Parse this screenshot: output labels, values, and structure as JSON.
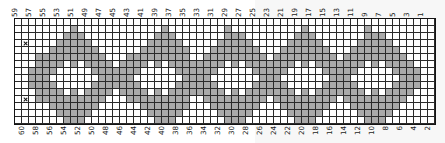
{
  "chart_data": {
    "type": "heatmap",
    "title": "",
    "xlabel": "",
    "ylabel": "",
    "columns": 60,
    "rows": 15,
    "grid_on": true,
    "legend": [],
    "colors": {
      "filled": "#a9a9a9",
      "empty": "#ffffff",
      "gridline": "#2a2a2a",
      "border": "#141414",
      "mark": "#141414"
    },
    "top_axis_labels": [
      "59",
      "",
      "57",
      "",
      "55",
      "",
      "53",
      "",
      "51",
      "",
      "49",
      "",
      "47",
      "",
      "45",
      "",
      "43",
      "",
      "41",
      "",
      "39",
      "",
      "37",
      "",
      "35",
      "",
      "33",
      "",
      "31",
      "",
      "29",
      "",
      "27",
      "",
      "25",
      "",
      "23",
      "",
      "21",
      "",
      "19",
      "",
      "17",
      "",
      "15",
      "",
      "13",
      "",
      "11",
      "",
      "9",
      "",
      "7",
      "",
      "5",
      "",
      "3",
      "",
      "1",
      ""
    ],
    "bottom_axis_labels": [
      "60",
      "",
      "58",
      "",
      "56",
      "",
      "54",
      "",
      "52",
      "",
      "50",
      "",
      "48",
      "",
      "46",
      "",
      "44",
      "",
      "42",
      "",
      "40",
      "",
      "38",
      "",
      "36",
      "",
      "34",
      "",
      "32",
      "",
      "30",
      "",
      "28",
      "",
      "26",
      "",
      "24",
      "",
      "22",
      "",
      "20",
      "",
      "18",
      "",
      "16",
      "",
      "14",
      "",
      "12",
      "",
      "10",
      "",
      "8",
      "",
      "6",
      "",
      "4",
      "",
      "2",
      ""
    ],
    "marks": [
      {
        "row": 3,
        "col": 1,
        "symbol": "x"
      },
      {
        "row": 11,
        "col": 1,
        "symbol": "x"
      }
    ],
    "matrix": [
      [
        0,
        0,
        0,
        0,
        0,
        0,
        0,
        0,
        0,
        0,
        0,
        0,
        0,
        0,
        0,
        0,
        0,
        0,
        0,
        0,
        0,
        0,
        0,
        0,
        0,
        0,
        0,
        0,
        0,
        0,
        0,
        0,
        0,
        0,
        0,
        0,
        0,
        0,
        0,
        0,
        0,
        0,
        0,
        0,
        0,
        0,
        0,
        0,
        0,
        0,
        0,
        0,
        0,
        0,
        0,
        0,
        0,
        0,
        0,
        0
      ],
      [
        0,
        0,
        0,
        0,
        0,
        0,
        0,
        0,
        1,
        0,
        0,
        0,
        0,
        0,
        0,
        0,
        0,
        0,
        0,
        0,
        0,
        1,
        0,
        0,
        0,
        0,
        0,
        0,
        0,
        0,
        1,
        0,
        0,
        0,
        0,
        0,
        0,
        0,
        0,
        0,
        0,
        1,
        0,
        0,
        0,
        0,
        0,
        0,
        0,
        0,
        1,
        0,
        0,
        0,
        0,
        0,
        0,
        0,
        0,
        0
      ],
      [
        0,
        0,
        0,
        0,
        0,
        0,
        0,
        1,
        1,
        1,
        0,
        0,
        0,
        0,
        0,
        0,
        0,
        0,
        0,
        0,
        1,
        1,
        1,
        0,
        0,
        0,
        0,
        0,
        0,
        0,
        1,
        1,
        1,
        0,
        0,
        0,
        0,
        0,
        0,
        0,
        1,
        1,
        1,
        0,
        0,
        0,
        0,
        0,
        0,
        0,
        1,
        1,
        1,
        0,
        0,
        0,
        0,
        0,
        0,
        0
      ],
      [
        0,
        0,
        0,
        0,
        0,
        0,
        1,
        1,
        1,
        1,
        1,
        0,
        0,
        0,
        0,
        0,
        0,
        0,
        0,
        1,
        1,
        1,
        1,
        1,
        0,
        0,
        0,
        0,
        0,
        1,
        1,
        1,
        1,
        1,
        0,
        0,
        0,
        0,
        0,
        1,
        1,
        1,
        1,
        1,
        0,
        0,
        0,
        0,
        0,
        1,
        1,
        1,
        1,
        1,
        0,
        0,
        0,
        0,
        0,
        0
      ],
      [
        0,
        0,
        0,
        0,
        0,
        1,
        1,
        1,
        1,
        1,
        1,
        1,
        0,
        0,
        0,
        0,
        0,
        0,
        1,
        1,
        1,
        1,
        1,
        1,
        1,
        0,
        0,
        0,
        1,
        1,
        1,
        1,
        1,
        1,
        1,
        0,
        0,
        0,
        1,
        1,
        1,
        1,
        1,
        1,
        1,
        0,
        0,
        0,
        1,
        1,
        1,
        1,
        1,
        1,
        1,
        0,
        0,
        0,
        0,
        0
      ],
      [
        0,
        0,
        0,
        1,
        1,
        1,
        1,
        1,
        1,
        1,
        1,
        1,
        1,
        0,
        0,
        0,
        1,
        1,
        1,
        1,
        1,
        1,
        1,
        1,
        1,
        0,
        0,
        1,
        1,
        1,
        1,
        1,
        1,
        1,
        1,
        1,
        0,
        1,
        1,
        1,
        1,
        1,
        1,
        1,
        1,
        1,
        0,
        1,
        1,
        1,
        1,
        1,
        1,
        1,
        1,
        1,
        0,
        0,
        0,
        0
      ],
      [
        0,
        0,
        0,
        1,
        1,
        1,
        1,
        0,
        1,
        0,
        1,
        1,
        1,
        1,
        0,
        1,
        1,
        1,
        1,
        0,
        1,
        0,
        1,
        1,
        1,
        1,
        1,
        1,
        1,
        1,
        0,
        1,
        0,
        1,
        1,
        1,
        1,
        1,
        1,
        1,
        0,
        1,
        0,
        1,
        1,
        1,
        1,
        1,
        1,
        1,
        0,
        1,
        0,
        1,
        1,
        1,
        1,
        0,
        0,
        0
      ],
      [
        0,
        0,
        1,
        1,
        1,
        1,
        0,
        0,
        0,
        0,
        0,
        1,
        1,
        1,
        1,
        1,
        1,
        1,
        0,
        0,
        0,
        0,
        0,
        1,
        1,
        1,
        1,
        1,
        1,
        0,
        0,
        0,
        0,
        0,
        1,
        1,
        1,
        1,
        1,
        0,
        0,
        0,
        0,
        0,
        1,
        1,
        1,
        1,
        1,
        0,
        0,
        0,
        0,
        0,
        1,
        1,
        1,
        1,
        0,
        0
      ],
      [
        0,
        0,
        1,
        1,
        1,
        0,
        0,
        0,
        0,
        0,
        0,
        0,
        1,
        1,
        1,
        1,
        1,
        0,
        0,
        0,
        0,
        0,
        0,
        0,
        1,
        1,
        1,
        1,
        0,
        0,
        0,
        0,
        0,
        0,
        0,
        1,
        1,
        1,
        0,
        0,
        0,
        0,
        0,
        0,
        0,
        1,
        1,
        1,
        0,
        0,
        0,
        0,
        0,
        0,
        0,
        1,
        1,
        1,
        0,
        0
      ],
      [
        0,
        0,
        1,
        1,
        1,
        1,
        0,
        0,
        0,
        0,
        0,
        1,
        1,
        1,
        1,
        1,
        1,
        1,
        0,
        0,
        0,
        0,
        0,
        1,
        1,
        1,
        1,
        1,
        1,
        0,
        0,
        0,
        0,
        0,
        1,
        1,
        1,
        1,
        1,
        0,
        0,
        0,
        0,
        0,
        1,
        1,
        1,
        1,
        1,
        0,
        0,
        0,
        0,
        0,
        1,
        1,
        1,
        1,
        0,
        0
      ],
      [
        0,
        0,
        0,
        1,
        1,
        1,
        1,
        0,
        1,
        0,
        1,
        1,
        1,
        1,
        0,
        1,
        1,
        1,
        1,
        0,
        1,
        0,
        1,
        1,
        1,
        1,
        1,
        1,
        1,
        1,
        0,
        1,
        0,
        1,
        1,
        1,
        1,
        1,
        1,
        1,
        0,
        1,
        0,
        1,
        1,
        1,
        1,
        1,
        1,
        1,
        0,
        1,
        0,
        1,
        1,
        1,
        1,
        0,
        0,
        0
      ],
      [
        0,
        0,
        0,
        1,
        1,
        1,
        1,
        1,
        1,
        1,
        1,
        1,
        1,
        0,
        0,
        0,
        1,
        1,
        1,
        1,
        1,
        1,
        1,
        1,
        1,
        0,
        0,
        1,
        1,
        1,
        1,
        1,
        1,
        1,
        1,
        1,
        0,
        1,
        1,
        1,
        1,
        1,
        1,
        1,
        1,
        1,
        0,
        1,
        1,
        1,
        1,
        1,
        1,
        1,
        1,
        1,
        0,
        0,
        0,
        0
      ],
      [
        0,
        0,
        0,
        0,
        0,
        1,
        1,
        1,
        1,
        1,
        1,
        1,
        0,
        0,
        0,
        0,
        0,
        0,
        1,
        1,
        1,
        1,
        1,
        1,
        1,
        0,
        0,
        0,
        1,
        1,
        1,
        1,
        1,
        1,
        1,
        0,
        0,
        0,
        1,
        1,
        1,
        1,
        1,
        1,
        1,
        0,
        0,
        0,
        1,
        1,
        1,
        1,
        1,
        1,
        1,
        0,
        0,
        0,
        0,
        0
      ],
      [
        0,
        0,
        0,
        0,
        0,
        0,
        1,
        1,
        1,
        1,
        1,
        0,
        0,
        0,
        0,
        0,
        0,
        0,
        0,
        1,
        1,
        1,
        1,
        1,
        0,
        0,
        0,
        0,
        0,
        1,
        1,
        1,
        1,
        1,
        0,
        0,
        0,
        0,
        0,
        1,
        1,
        1,
        1,
        1,
        0,
        0,
        0,
        0,
        0,
        1,
        1,
        1,
        1,
        1,
        0,
        0,
        0,
        0,
        0,
        0
      ],
      [
        0,
        0,
        0,
        0,
        0,
        0,
        0,
        1,
        1,
        1,
        0,
        0,
        0,
        0,
        0,
        0,
        0,
        0,
        0,
        0,
        1,
        1,
        1,
        0,
        0,
        0,
        0,
        0,
        0,
        0,
        1,
        1,
        1,
        0,
        0,
        0,
        0,
        0,
        0,
        0,
        1,
        1,
        1,
        0,
        0,
        0,
        0,
        0,
        0,
        0,
        1,
        1,
        1,
        0,
        0,
        0,
        0,
        0,
        0,
        0
      ]
    ]
  }
}
